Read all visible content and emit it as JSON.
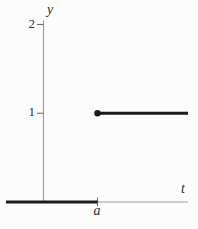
{
  "figure": {
    "background": "#fcfcfc",
    "axis_color": "#9a9a9a",
    "tick_color": "#6f6f6f",
    "curve_color": "#1b1b1b",
    "text_color": "#2e2e2e"
  },
  "chart_data": {
    "type": "line",
    "subtype": "unit step function with jump at t = a",
    "title": "",
    "xlabel": "t",
    "ylabel": "y",
    "x_tick_labels": [
      "a"
    ],
    "y_tick_labels": [
      "1",
      "2"
    ],
    "y_ticks": [
      1,
      2
    ],
    "ylim": [
      0,
      2.05
    ],
    "grid": false,
    "legend": false,
    "series": [
      {
        "name": "y = 0 for t < a",
        "y": 0,
        "from_x": "left edge",
        "to_x": "a",
        "style": "thick"
      },
      {
        "name": "y = 1 for t >= a",
        "y": 1,
        "from_x": "a",
        "to_x": "right edge",
        "style": "thick",
        "endpoint": "filled dot at (a, 1)"
      }
    ]
  }
}
